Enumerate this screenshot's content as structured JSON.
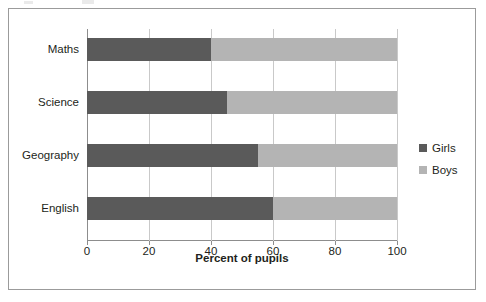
{
  "chart_data": {
    "type": "bar",
    "orientation": "horizontal",
    "stacked": true,
    "title": "",
    "xlabel": "Percent of pupils",
    "ylabel": "",
    "xlim": [
      0,
      100
    ],
    "xticks": [
      "0",
      "20",
      "40",
      "60",
      "80",
      "100"
    ],
    "grid": "vertical",
    "legend_position": "right",
    "categories": [
      "Maths",
      "Science",
      "Geography",
      "English"
    ],
    "series": [
      {
        "name": "Girls",
        "color": "#5a5a5a",
        "values": [
          40,
          45,
          55,
          60
        ]
      },
      {
        "name": "Boys",
        "color": "#b4b4b4",
        "values": [
          60,
          55,
          45,
          40
        ]
      }
    ]
  },
  "legend": {
    "items": [
      {
        "label": "Girls",
        "color": "#5a5a5a"
      },
      {
        "label": "Boys",
        "color": "#b4b4b4"
      }
    ]
  }
}
